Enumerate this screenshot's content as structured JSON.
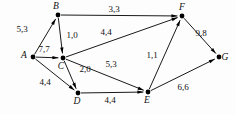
{
  "diagram": {
    "background_color": "#fdfdfd",
    "stroke_color": "#1a1a1a",
    "node_color": "#000000",
    "text_color": "#111111"
  },
  "nodes": [
    {
      "id": "A",
      "label": "A",
      "x": 33,
      "y": 57,
      "label_dx": -9,
      "label_dy": 1
    },
    {
      "id": "B",
      "label": "B",
      "x": 58,
      "y": 15,
      "label_dx": -2,
      "label_dy": -6
    },
    {
      "id": "C",
      "label": "C",
      "x": 63,
      "y": 58,
      "label_dx": -2,
      "label_dy": 11
    },
    {
      "id": "D",
      "label": "D",
      "x": 78,
      "y": 93,
      "label_dx": -1,
      "label_dy": 11
    },
    {
      "id": "E",
      "label": "E",
      "x": 148,
      "y": 92,
      "label_dx": -1,
      "label_dy": 11
    },
    {
      "id": "F",
      "label": "F",
      "x": 182,
      "y": 16,
      "label_dx": 0,
      "label_dy": -6
    },
    {
      "id": "G",
      "label": "G",
      "x": 219,
      "y": 57,
      "label_dx": 6,
      "label_dy": 3
    }
  ],
  "edges": [
    {
      "id": "A-B",
      "from": "A",
      "to": "B",
      "label": "5,3",
      "label_x": 22,
      "label_y": 32
    },
    {
      "id": "A-C",
      "from": "A",
      "to": "C",
      "label": "7,7",
      "label_x": 44,
      "label_y": 52
    },
    {
      "id": "A-D",
      "from": "A",
      "to": "D",
      "label": "4,4",
      "label_x": 45,
      "label_y": 85
    },
    {
      "id": "B-C",
      "from": "B",
      "to": "C",
      "label": "1,0",
      "label_x": 72,
      "label_y": 38
    },
    {
      "id": "B-F",
      "from": "B",
      "to": "F",
      "label": "3,3",
      "label_x": 114,
      "label_y": 12
    },
    {
      "id": "C-F",
      "from": "C",
      "to": "F",
      "label": "4,4",
      "label_x": 106,
      "label_y": 35
    },
    {
      "id": "C-D",
      "from": "C",
      "to": "D",
      "label": "2,0",
      "label_x": 85,
      "label_y": 72
    },
    {
      "id": "C-E",
      "from": "C",
      "to": "E",
      "label": "5,3",
      "label_x": 111,
      "label_y": 67
    },
    {
      "id": "D-E",
      "from": "D",
      "to": "E",
      "label": "4,4",
      "label_x": 110,
      "label_y": 103
    },
    {
      "id": "E-F",
      "from": "E",
      "to": "F",
      "label": "1,1",
      "label_x": 152,
      "label_y": 58
    },
    {
      "id": "E-G",
      "from": "E",
      "to": "G",
      "label": "6,6",
      "label_x": 183,
      "label_y": 90
    },
    {
      "id": "F-G",
      "from": "F",
      "to": "G",
      "label": "9,8",
      "label_x": 201,
      "label_y": 36
    }
  ]
}
